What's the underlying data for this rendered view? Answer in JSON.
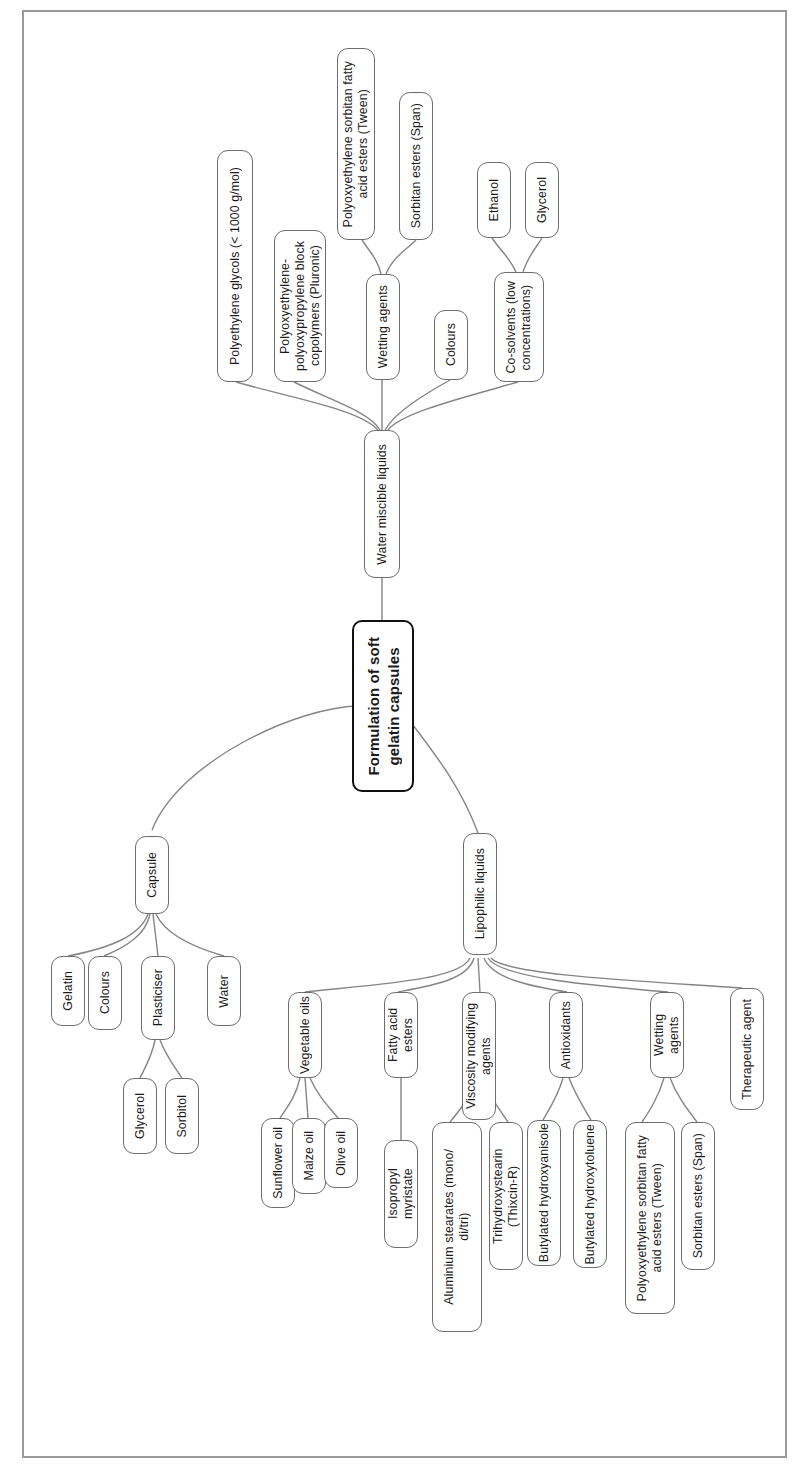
{
  "diagram": {
    "title": "Formulation of soft gelatin capsules",
    "type": "tree-mindmap",
    "orientation": "rotated-90-ccw",
    "frame_color": "#9a9a9a",
    "node_border_color": "#6e6e6e",
    "root_border_color": "#111111",
    "edge_color": "#808080",
    "background": "#ffffff"
  },
  "nodes": {
    "root": "Formulation of soft\ngelatin capsules",
    "water_miscible": "Water miscible liquids",
    "peg": "Polyethylene glycols (< 1000 g/mol)",
    "pluronic": "Polyoxyethylene-\npolyoxypropylene block\ncopolymers (Pluronic)",
    "wm_wetting": "Wetting agents",
    "wm_tween": "Polyoxyethylene sorbitan fatty\nacid esters (Tween)",
    "wm_span": "Sorbitan esters (Span)",
    "wm_colours": "Colours",
    "cosolvents": "Co-solvents (low\nconcentrations)",
    "ethanol": "Ethanol",
    "glycerol_cs": "Glycerol",
    "capsule": "Capsule",
    "gelatin": "Gelatin",
    "cap_colours": "Colours",
    "plasticiser": "Plasticiser",
    "glycerol_pl": "Glycerol",
    "sorbitol": "Sorbitol",
    "water": "Water",
    "lipophilic": "Lipophilic liquids",
    "veg_oils": "Vegetable oils",
    "sunflower": "Sunflower oil",
    "maize": "Maize oil",
    "olive": "Olive oil",
    "fatty_esters": "Fatty acid esters",
    "isopropyl": "Isopropyl myristate",
    "viscosity": "Viscosity modifying agents",
    "alum_stearates": "Aluminium stearates (mono/\ndi/tri)",
    "trihydroxy": "Trihydroxystearin (Thixcin-R)",
    "antioxidants": "Antioxidants",
    "bha": "Butylated hydroxyanisole",
    "bht": "Butylated hydroxytoluene",
    "lip_wetting": "Wetting agents",
    "lip_tween": "Polyoxyethylene sorbitan fatty\nacid esters (Tween)",
    "lip_span": "Sorbitan esters (Span)",
    "therapeutic": "Therapeutic agent"
  },
  "edges": [
    [
      "root",
      "water_miscible"
    ],
    [
      "root",
      "capsule"
    ],
    [
      "root",
      "lipophilic"
    ],
    [
      "water_miscible",
      "peg"
    ],
    [
      "water_miscible",
      "pluronic"
    ],
    [
      "water_miscible",
      "wm_wetting"
    ],
    [
      "water_miscible",
      "wm_colours"
    ],
    [
      "water_miscible",
      "cosolvents"
    ],
    [
      "wm_wetting",
      "wm_tween"
    ],
    [
      "wm_wetting",
      "wm_span"
    ],
    [
      "cosolvents",
      "ethanol"
    ],
    [
      "cosolvents",
      "glycerol_cs"
    ],
    [
      "capsule",
      "gelatin"
    ],
    [
      "capsule",
      "cap_colours"
    ],
    [
      "capsule",
      "plasticiser"
    ],
    [
      "capsule",
      "water"
    ],
    [
      "plasticiser",
      "glycerol_pl"
    ],
    [
      "plasticiser",
      "sorbitol"
    ],
    [
      "lipophilic",
      "veg_oils"
    ],
    [
      "lipophilic",
      "fatty_esters"
    ],
    [
      "lipophilic",
      "viscosity"
    ],
    [
      "lipophilic",
      "antioxidants"
    ],
    [
      "lipophilic",
      "lip_wetting"
    ],
    [
      "lipophilic",
      "therapeutic"
    ],
    [
      "veg_oils",
      "sunflower"
    ],
    [
      "veg_oils",
      "maize"
    ],
    [
      "veg_oils",
      "olive"
    ],
    [
      "fatty_esters",
      "isopropyl"
    ],
    [
      "viscosity",
      "alum_stearates"
    ],
    [
      "viscosity",
      "trihydroxy"
    ],
    [
      "antioxidants",
      "bha"
    ],
    [
      "antioxidants",
      "bht"
    ],
    [
      "lip_wetting",
      "lip_tween"
    ],
    [
      "lip_wetting",
      "lip_span"
    ]
  ]
}
